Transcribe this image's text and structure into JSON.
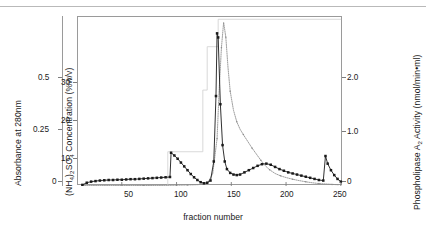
{
  "figure": {
    "x_title": "fraction number",
    "absorbance_title": "Absorbance at 280nm",
    "ammonium_title_pre": "(NH",
    "ammonium_title_mid": ")",
    "ammonium_title_post": "SO",
    "ammonium_title_end": " Concentration (%w/v)",
    "pla_title_pre": "Phospholipase A",
    "pla_title_post": " Activity (nmol/min•ml)"
  },
  "axes": {
    "absorbance_ticks": [
      "0.5",
      "0.25",
      "0"
    ],
    "ammonium_ticks": [
      "30",
      "20",
      "10"
    ],
    "x_ticks": [
      "50",
      "100",
      "150",
      "200",
      "250"
    ],
    "pla_ticks": [
      "2.0",
      "1.0",
      "0"
    ]
  },
  "chart_data": {
    "type": "line",
    "title": "",
    "xlabel": "fraction number",
    "ylabel": "Absorbance at 280nm",
    "y2label": "Phospholipase A2 Activity (nmol/min•ml)",
    "y3label": "(NH4)2SO4 Concentration (%w/v)",
    "xlim": [
      10,
      252
    ],
    "ylim_absorbance": [
      0,
      0.62
    ],
    "ylim_ammonium": [
      0,
      37
    ],
    "ylim_activity": [
      0,
      2.5
    ],
    "grid": false,
    "legend": "none",
    "series": [
      {
        "name": "Absorbance at 280nm",
        "axis": "left-absorbance",
        "style": "solid-line-square-markers",
        "color": "#1a1a1a",
        "x": [
          14,
          18,
          22,
          26,
          30,
          34,
          38,
          42,
          46,
          50,
          54,
          58,
          62,
          66,
          70,
          74,
          78,
          82,
          86,
          90,
          94,
          95,
          98,
          101,
          104,
          107,
          110,
          113,
          116,
          119,
          122,
          125,
          128,
          131,
          134,
          136,
          137,
          138,
          140,
          142,
          144,
          146,
          149,
          152,
          155,
          158,
          162,
          166,
          170,
          174,
          178,
          182,
          186,
          190,
          194,
          198,
          202,
          206,
          210,
          214,
          218,
          222,
          226,
          230,
          234,
          236,
          238,
          241,
          244,
          247,
          250
        ],
        "y": [
          0.004,
          0.012,
          0.016,
          0.018,
          0.02,
          0.021,
          0.022,
          0.022,
          0.023,
          0.023,
          0.024,
          0.025,
          0.025,
          0.026,
          0.027,
          0.028,
          0.029,
          0.03,
          0.031,
          0.032,
          0.033,
          0.122,
          0.112,
          0.1,
          0.086,
          0.072,
          0.058,
          0.044,
          0.032,
          0.022,
          0.014,
          0.01,
          0.012,
          0.02,
          0.09,
          0.33,
          0.56,
          0.545,
          0.3,
          0.15,
          0.09,
          0.062,
          0.048,
          0.042,
          0.04,
          0.042,
          0.05,
          0.058,
          0.066,
          0.074,
          0.08,
          0.082,
          0.078,
          0.07,
          0.062,
          0.056,
          0.05,
          0.046,
          0.042,
          0.038,
          0.034,
          0.03,
          0.026,
          0.022,
          0.02,
          0.11,
          0.082,
          0.058,
          0.04,
          0.026,
          0.016
        ]
      },
      {
        "name": "Phospholipase A2 Activity",
        "axis": "right-activity",
        "style": "dotted-line",
        "color": "#8c8c8c",
        "x": [
          14,
          40,
          70,
          95,
          110,
          120,
          128,
          133,
          137,
          139,
          141,
          143,
          145,
          147,
          149,
          152,
          155,
          158,
          161,
          165,
          169,
          173,
          177,
          181,
          185,
          190,
          195,
          200,
          206,
          212,
          218,
          224,
          230,
          236,
          242,
          248
        ],
        "y": [
          0.005,
          0.006,
          0.007,
          0.01,
          0.015,
          0.02,
          0.035,
          0.18,
          0.7,
          1.45,
          2.05,
          2.42,
          2.2,
          1.75,
          1.4,
          1.12,
          0.95,
          0.84,
          0.76,
          0.66,
          0.56,
          0.47,
          0.38,
          0.3,
          0.24,
          0.185,
          0.15,
          0.125,
          0.1,
          0.08,
          0.062,
          0.048,
          0.036,
          0.03,
          0.024,
          0.018
        ]
      },
      {
        "name": "(NH4)2SO4 Concentration",
        "axis": "left-ammonium",
        "style": "thin-step-line",
        "color": "#cfcfcf",
        "x": [
          14,
          92,
          92,
          124,
          124,
          128,
          128,
          138,
          138,
          250
        ],
        "y": [
          0,
          0,
          7.5,
          7.5,
          21,
          21,
          30.5,
          30.5,
          36.5,
          36.5
        ]
      }
    ],
    "annotations": [
      {
        "label": "absorbance peak near fraction 95",
        "x": 95,
        "y": 0.122
      },
      {
        "label": "major absorbance peak",
        "x": 137,
        "y": 0.56
      },
      {
        "label": "activity peak",
        "x": 143,
        "y": 2.42
      },
      {
        "label": "late absorbance spike",
        "x": 236,
        "y": 0.11
      }
    ]
  }
}
